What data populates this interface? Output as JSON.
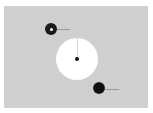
{
  "scene": {
    "background": "#ffffff",
    "panel_color": "#cfcfcf",
    "large_circle": {
      "cx": 77,
      "cy": 59,
      "r": 21,
      "color": "#ffffff"
    },
    "center_dot": {
      "cx": 77,
      "cy": 59,
      "r": 2,
      "color": "#111111"
    },
    "needle": {
      "x": 77,
      "y_top": 37,
      "y_bottom": 57
    },
    "ring_object": {
      "cx": 51,
      "cy": 29,
      "r": 6,
      "hole_r": 1.5,
      "tail_length": 13
    },
    "dot_object": {
      "cx": 99,
      "cy": 88,
      "r": 5.5,
      "tail_length": 14
    }
  }
}
